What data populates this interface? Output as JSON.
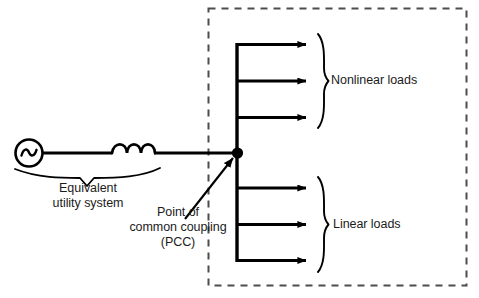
{
  "figure": {
    "caption": "",
    "background_color": "#ffffff",
    "line_color": "#000000",
    "text_color": "#1b1b1b",
    "dashed_box_color": "#4d4d4d"
  },
  "source": {
    "symbol": "ac-voltage-source",
    "waveform": "sine"
  },
  "impedance": {
    "symbol": "inductor",
    "coil_count": 3
  },
  "labels": {
    "equivalent_utility_system": "Equivalent\nutility system",
    "point_of_common_coupling": "Point of\ncommon coupling\n(PCC)",
    "nonlinear_loads": "Nonlinear loads",
    "linear_loads": "Linear loads"
  },
  "load_groups": [
    {
      "name": "nonlinear-loads",
      "label": "Nonlinear loads",
      "feeder_count": 3,
      "brace": "right-curly-brace"
    },
    {
      "name": "linear-loads",
      "label": "Linear loads",
      "feeder_count": 3,
      "brace": "right-curly-brace"
    }
  ],
  "nodes": [
    {
      "name": "pcc-node",
      "type": "junction-dot"
    }
  ],
  "annotations": [
    {
      "name": "pcc-pointer-arrow",
      "points_to": "pcc-node"
    },
    {
      "name": "utility-system-brace",
      "spans": "source-and-inductor"
    }
  ],
  "customer_boundary": {
    "name": "customer-facility-boundary",
    "style": "dashed"
  }
}
